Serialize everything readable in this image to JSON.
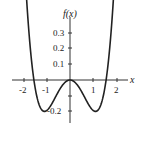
{
  "chart_data": {
    "type": "line",
    "title": "",
    "xlabel": "x",
    "ylabel": "f(x)",
    "x_ticks": [
      "-2",
      "-1",
      "1",
      "2"
    ],
    "y_ticks": [
      "0.3",
      "0.2",
      "0.1",
      "-0.2"
    ],
    "xlim": [
      -2.2,
      2.3
    ],
    "ylim": [
      -0.27,
      0.4
    ],
    "grid": false,
    "series": [
      {
        "name": "f(x)",
        "x": [
          -1.9,
          -1.75,
          -1.55,
          -1.3,
          -1.1,
          -0.9,
          -0.6,
          -0.3,
          0,
          0.3,
          0.6,
          0.9,
          1.1,
          1.3,
          1.55,
          1.75,
          1.9
        ],
        "y": [
          0.37,
          0.22,
          0.0,
          -0.15,
          -0.2,
          -0.19,
          -0.12,
          -0.035,
          0,
          -0.035,
          -0.12,
          -0.19,
          -0.2,
          -0.15,
          0.0,
          0.22,
          0.37
        ]
      }
    ],
    "color": "#222222"
  }
}
